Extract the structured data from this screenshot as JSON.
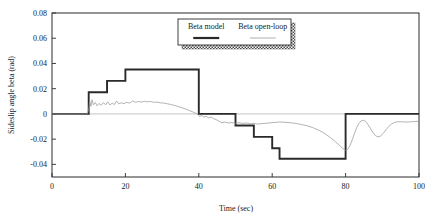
{
  "chart_data": {
    "type": "line",
    "title": "",
    "xlabel": "Time (sec)",
    "ylabel": "Sideslip angle beta (rad)",
    "xlim": [
      0,
      100
    ],
    "ylim": [
      -0.05,
      0.08
    ],
    "xticks": [
      0,
      20,
      40,
      60,
      80,
      100
    ],
    "xticklabels": [
      "0",
      "20",
      "40",
      "60",
      "80",
      "100"
    ],
    "yticks": [
      0.08,
      0.06,
      0.04,
      0.02,
      0,
      -0.02,
      -0.04
    ],
    "yticklabels": [
      "0.08",
      "0.06",
      "0.04",
      "0.02",
      "0",
      "-0.02",
      "-0.04"
    ],
    "grid": false,
    "legend_position": "top-center",
    "series": [
      {
        "name": "Beta model",
        "style": "thick-solid-black",
        "color": "#2a2a2a",
        "points": [
          [
            0,
            0
          ],
          [
            10,
            0
          ],
          [
            10,
            0.0172
          ],
          [
            15,
            0.0172
          ],
          [
            15,
            0.0262
          ],
          [
            20,
            0.0262
          ],
          [
            20,
            0.0352
          ],
          [
            40,
            0.0352
          ],
          [
            40,
            0
          ],
          [
            50,
            0
          ],
          [
            50,
            -0.0092
          ],
          [
            55,
            -0.0092
          ],
          [
            55,
            -0.0182
          ],
          [
            60,
            -0.0182
          ],
          [
            60,
            -0.0272
          ],
          [
            62,
            -0.0272
          ],
          [
            62,
            -0.0355
          ],
          [
            80,
            -0.0355
          ],
          [
            80,
            0
          ],
          [
            100,
            0
          ]
        ]
      },
      {
        "name": "Beta open-loop",
        "style": "thin-solid-gray",
        "color": "#9a9a9a",
        "points": [
          [
            0,
            0
          ],
          [
            9.6,
            0
          ],
          [
            10.0,
            0.0035
          ],
          [
            10.3,
            0.0098
          ],
          [
            10.6,
            0.006
          ],
          [
            10.9,
            0.0112
          ],
          [
            11.3,
            0.0072
          ],
          [
            11.8,
            0.009
          ],
          [
            12.3,
            0.0064
          ],
          [
            12.8,
            0.0083
          ],
          [
            13.4,
            0.0068
          ],
          [
            14.0,
            0.009
          ],
          [
            14.6,
            0.0072
          ],
          [
            15.2,
            0.0096
          ],
          [
            15.8,
            0.007
          ],
          [
            16.4,
            0.0086
          ],
          [
            17.0,
            0.0074
          ],
          [
            17.6,
            0.0102
          ],
          [
            18.2,
            0.008
          ],
          [
            18.9,
            0.0088
          ],
          [
            19.6,
            0.0082
          ],
          [
            20.4,
            0.0092
          ],
          [
            21.2,
            0.0086
          ],
          [
            22.0,
            0.0104
          ],
          [
            22.8,
            0.0092
          ],
          [
            23.6,
            0.0098
          ],
          [
            24.4,
            0.0094
          ],
          [
            25.2,
            0.01
          ],
          [
            26.0,
            0.0096
          ],
          [
            26.8,
            0.0099
          ],
          [
            27.6,
            0.0092
          ],
          [
            28.5,
            0.0094
          ],
          [
            29.5,
            0.0088
          ],
          [
            30.5,
            0.0086
          ],
          [
            31.5,
            0.008
          ],
          [
            32.5,
            0.0074
          ],
          [
            33.5,
            0.0066
          ],
          [
            34.5,
            0.0058
          ],
          [
            35.5,
            0.0048
          ],
          [
            36.5,
            0.0038
          ],
          [
            37.5,
            0.0026
          ],
          [
            38.5,
            0.0014
          ],
          [
            39.3,
            0.0004
          ],
          [
            39.8,
            -0.0006
          ],
          [
            40.2,
            -0.002
          ],
          [
            40.8,
            -0.0012
          ],
          [
            41.4,
            -0.0026
          ],
          [
            42.0,
            -0.0018
          ],
          [
            42.7,
            -0.0032
          ],
          [
            43.4,
            -0.0024
          ],
          [
            44.1,
            -0.0038
          ],
          [
            44.8,
            -0.0046
          ],
          [
            45.5,
            -0.0058
          ],
          [
            46.3,
            -0.007
          ],
          [
            47.1,
            -0.0064
          ],
          [
            48.0,
            -0.0072
          ],
          [
            49.0,
            -0.0068
          ],
          [
            50.0,
            -0.0074
          ],
          [
            51.0,
            -0.007
          ],
          [
            52.0,
            -0.0076
          ],
          [
            53.0,
            -0.0072
          ],
          [
            54.0,
            -0.0078
          ],
          [
            55.0,
            -0.0074
          ],
          [
            56.0,
            -0.008
          ],
          [
            57.5,
            -0.0076
          ],
          [
            59.0,
            -0.0072
          ],
          [
            60.5,
            -0.0068
          ],
          [
            62.0,
            -0.0064
          ],
          [
            63.5,
            -0.0066
          ],
          [
            65.0,
            -0.007
          ],
          [
            66.5,
            -0.0076
          ],
          [
            68.0,
            -0.0084
          ],
          [
            69.5,
            -0.0094
          ],
          [
            71.0,
            -0.0108
          ],
          [
            72.5,
            -0.0126
          ],
          [
            74.0,
            -0.015
          ],
          [
            75.5,
            -0.018
          ],
          [
            77.0,
            -0.0214
          ],
          [
            78.3,
            -0.0248
          ],
          [
            79.3,
            -0.0275
          ],
          [
            80.0,
            -0.0288
          ],
          [
            80.6,
            -0.028
          ],
          [
            81.2,
            -0.025
          ],
          [
            81.8,
            -0.0206
          ],
          [
            82.4,
            -0.0156
          ],
          [
            83.0,
            -0.011
          ],
          [
            83.6,
            -0.0076
          ],
          [
            84.2,
            -0.0056
          ],
          [
            84.8,
            -0.005
          ],
          [
            85.4,
            -0.0058
          ],
          [
            86.0,
            -0.008
          ],
          [
            86.7,
            -0.0112
          ],
          [
            87.4,
            -0.0146
          ],
          [
            88.1,
            -0.0172
          ],
          [
            88.8,
            -0.0182
          ],
          [
            89.5,
            -0.0176
          ],
          [
            90.2,
            -0.0156
          ],
          [
            91.0,
            -0.0126
          ],
          [
            91.8,
            -0.0098
          ],
          [
            92.6,
            -0.0078
          ],
          [
            93.4,
            -0.0066
          ],
          [
            94.2,
            -0.0062
          ],
          [
            95.0,
            -0.0062
          ],
          [
            96.0,
            -0.0064
          ],
          [
            97.0,
            -0.0064
          ],
          [
            98.0,
            -0.0062
          ],
          [
            99.0,
            -0.006
          ],
          [
            100,
            -0.0058
          ]
        ]
      }
    ],
    "legend": [
      {
        "label": "Beta model"
      },
      {
        "label": "Beta open-loop"
      }
    ]
  }
}
